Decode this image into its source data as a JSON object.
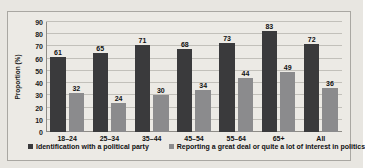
{
  "figure": {
    "cut_text_above": "",
    "frame_color": "#a9a7a2",
    "background_color": "#eceae5"
  },
  "chart_data": {
    "type": "bar",
    "title": "",
    "xlabel": "",
    "ylabel": "Proportion (%)",
    "ylim": [
      0,
      90
    ],
    "ytick_step": 10,
    "yticks": [
      0,
      10,
      20,
      30,
      40,
      50,
      60,
      70,
      80,
      90
    ],
    "grid": true,
    "legend_position": "bottom",
    "categories": [
      "18–24",
      "25–34",
      "35–44",
      "45–54",
      "55–64",
      "65+",
      "All"
    ],
    "series": [
      {
        "name": "Identification with a political party",
        "color": "#3a3a3c",
        "values": [
          61,
          65,
          71,
          68,
          73,
          83,
          72
        ]
      },
      {
        "name": "Reporting a great deal or quite a lot of interest in politics",
        "color": "#8b8b8d",
        "values": [
          32,
          24,
          30,
          34,
          44,
          49,
          36
        ]
      }
    ]
  }
}
